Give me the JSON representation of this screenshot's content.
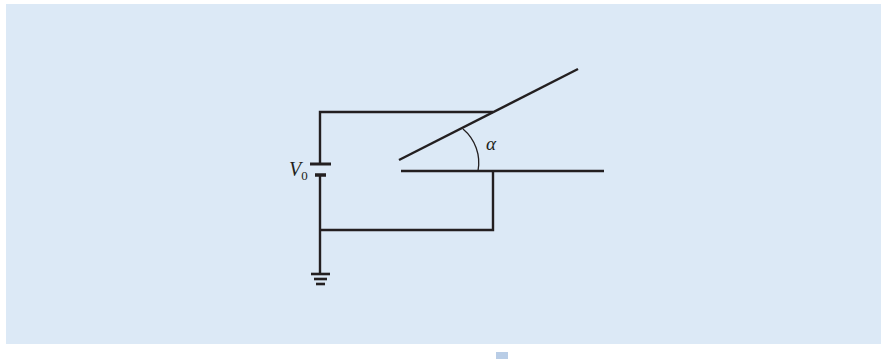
{
  "figure": {
    "background_color": "#dce9f6",
    "line_color": "#231f20",
    "labels": {
      "voltage_symbol": "V",
      "voltage_subscript": "0",
      "angle_symbol": "α"
    },
    "components": [
      {
        "type": "battery",
        "label": "V0"
      },
      {
        "type": "ground"
      },
      {
        "type": "inclined-plate",
        "angle_label": "α"
      },
      {
        "type": "horizontal-plate"
      }
    ]
  }
}
